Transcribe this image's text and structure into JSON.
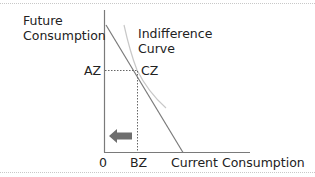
{
  "diagram": {
    "type": "economics-indifference-curve",
    "y_axis_label": [
      "Future",
      "Consumption"
    ],
    "x_axis_label": "Current Consumption",
    "curve_label": [
      "Indifference",
      "Curve"
    ],
    "origin_label": "0",
    "point_labels": {
      "y_intercept_point": "AZ",
      "tangency_point": "CZ",
      "x_point": "BZ"
    },
    "arrow_direction": "left",
    "colors": {
      "axes": "#7a7a7a",
      "budget_line": "#7a7a7a",
      "indifference_curve": "#c8c8c8",
      "dotted_guides": "#666666",
      "arrow": "#6e6e6e",
      "frame_dotted": "#c8c8c8"
    }
  }
}
